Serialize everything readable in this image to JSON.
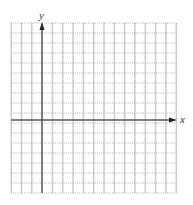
{
  "diagram": {
    "type": "coordinate-grid",
    "axes": {
      "x_label": "x",
      "y_label": "y"
    },
    "grid": {
      "columns": 16,
      "rows": 17,
      "left": 11,
      "top": 23,
      "right": 176,
      "bottom": 193,
      "origin_column": 3,
      "origin_x_px": 42,
      "origin_y_px": 120
    },
    "colors": {
      "grid_line": "#c8c8c8",
      "grid_dot": "#9a9a9a",
      "axis": "#555555",
      "arrow": "#222222",
      "label": "#333333"
    }
  }
}
